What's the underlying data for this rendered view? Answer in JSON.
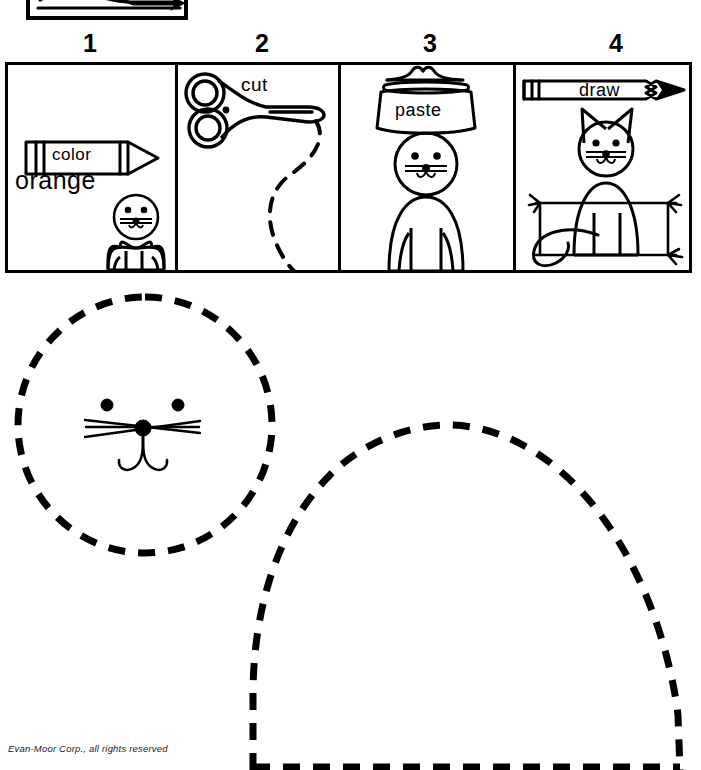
{
  "page": {
    "background_color": "#ffffff",
    "ink_color": "#000000",
    "footer_credit": "Evan-Moor Corp., all rights reserved"
  },
  "top_fragment": {
    "description": "clipped bottom edge of previous step panel showing cat tail and ground line with arrow",
    "icon": "partial-panel-fragment"
  },
  "steps": [
    {
      "number": "1",
      "action_label": "color",
      "tool_icon": "crayon-icon",
      "color_word": "orange",
      "shows": "cat head circle and body shape to color"
    },
    {
      "number": "2",
      "action_label": "cut",
      "tool_icon": "scissors-icon",
      "shows": "dashed cutting line"
    },
    {
      "number": "3",
      "action_label": "paste",
      "tool_icon": "paste-jar-icon",
      "shows": "head pasted onto body"
    },
    {
      "number": "4",
      "action_label": "draw",
      "tool_icon": "pencil-icon",
      "shows": "finished cat with ears, tail and whiskers on grass"
    }
  ],
  "cutouts": [
    {
      "name": "cat-head-cutout",
      "shape": "circle",
      "outline": "dashed",
      "features": [
        "two-eyes",
        "six-whiskers",
        "nose-dot",
        "curved-mouth"
      ]
    },
    {
      "name": "cat-body-cutout",
      "shape": "dome",
      "outline": "dashed",
      "features": [
        "runs-off-bottom-of-page"
      ]
    }
  ]
}
